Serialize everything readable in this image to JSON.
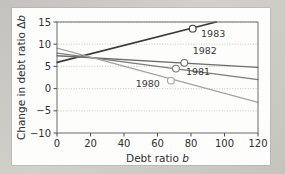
{
  "figure": {
    "background_color": "#c9c7c2",
    "card_color": "#fdfdfc",
    "frame_color": "#6b6b6b"
  },
  "chart_data": {
    "type": "line",
    "title": "",
    "xlabel": "Debt ratio b",
    "xlabel_main": "Debt ratio",
    "xlabel_symbol": "b",
    "ylabel": "Change in debt ratio Δb",
    "ylabel_main": "Change in debt ratio",
    "ylabel_symbol": "Δb",
    "xlim": [
      0,
      120
    ],
    "ylim": [
      -10,
      15
    ],
    "xticks": [
      0,
      20,
      40,
      60,
      80,
      100,
      120
    ],
    "xtick_labels": [
      "0",
      "20",
      "40",
      "60",
      "80",
      "100",
      "120"
    ],
    "yticks": [
      -10,
      -5,
      0,
      5,
      10,
      15
    ],
    "ytick_labels": [
      "−10",
      "−5",
      "0",
      "5",
      "10",
      "15"
    ],
    "grid": "dotted-horizontal",
    "legend": "inline-annotations",
    "series": [
      {
        "name": "1983",
        "color": "#3a3a3a",
        "width": 1.7,
        "line": [
          [
            0,
            5.9
          ],
          [
            95,
            15.0
          ]
        ],
        "marker": {
          "x": 81,
          "y": 13.5
        },
        "label": "1983",
        "label_x": 86,
        "label_y": 11.6
      },
      {
        "name": "1982",
        "color": "#6e6e6e",
        "width": 1.3,
        "line": [
          [
            0,
            7.4
          ],
          [
            120,
            4.8
          ]
        ],
        "marker": {
          "x": 76,
          "y": 5.8
        },
        "label": "1982",
        "label_x": 81,
        "label_y": 7.7
      },
      {
        "name": "1981",
        "color": "#7c7c7c",
        "width": 1.3,
        "line": [
          [
            0,
            8.0
          ],
          [
            120,
            2.0
          ]
        ],
        "marker": {
          "x": 71,
          "y": 4.5
        },
        "label": "1981",
        "label_x": 77,
        "label_y": 3.1
      },
      {
        "name": "1980",
        "color": "#a3a3a3",
        "width": 1.3,
        "line": [
          [
            0,
            9.1
          ],
          [
            120,
            -3.1
          ]
        ],
        "marker": {
          "x": 68,
          "y": 1.8
        },
        "label": "1980",
        "label_x": 47,
        "label_y": 0.3
      }
    ]
  }
}
